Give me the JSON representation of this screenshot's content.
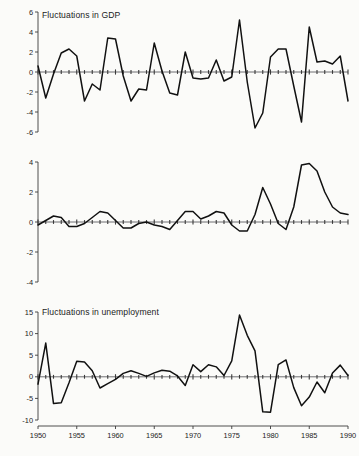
{
  "figure": {
    "background": "#fbfbf9",
    "line_color": "#111111",
    "axis_color": "#3a3a3a"
  },
  "panels": {
    "gdp": {
      "title": "Fluctuations in GDP"
    },
    "unemp": {
      "title": "Fluctuations in unemployment"
    },
    "infl": {
      "title": "Fluctuations in inflation"
    }
  },
  "chart_data": [
    {
      "type": "line",
      "title": "Fluctuations in GDP",
      "xlabel": "",
      "ylabel": "",
      "xlim": [
        1950,
        1990
      ],
      "ylim": [
        -6,
        6
      ],
      "yticks": [
        -6,
        -4,
        -2,
        0,
        2,
        4,
        6
      ],
      "ytick_labels": [
        "-6",
        "-4",
        "-2",
        "0",
        "2",
        "4",
        "6"
      ],
      "xticks": [
        1950,
        1955,
        1960,
        1965,
        1970,
        1975,
        1980,
        1985,
        1990
      ],
      "xtick_labels": [
        "1950",
        "1955",
        "1960",
        "1965",
        "1970",
        "1975",
        "1980",
        "1985",
        "1990"
      ],
      "minor_xticks_interval": 1,
      "grid": false,
      "legend": false,
      "zero_line": true,
      "x": [
        1950,
        1951,
        1952,
        1953,
        1954,
        1955,
        1956,
        1957,
        1958,
        1959,
        1960,
        1961,
        1962,
        1963,
        1964,
        1965,
        1966,
        1967,
        1968,
        1969,
        1970,
        1971,
        1972,
        1973,
        1974,
        1975,
        1976,
        1977,
        1978,
        1979,
        1980,
        1981,
        1982,
        1983,
        1984,
        1985,
        1986,
        1987,
        1988,
        1989,
        1990
      ],
      "values": [
        0.6,
        -2.6,
        -0.2,
        1.9,
        2.3,
        1.6,
        -2.9,
        -1.2,
        -1.8,
        3.4,
        3.3,
        -0.4,
        -2.9,
        -1.7,
        -1.8,
        2.9,
        0.1,
        -2.1,
        -2.3,
        2.0,
        -0.6,
        -0.7,
        -0.6,
        1.2,
        -0.9,
        -0.5,
        5.2,
        -1.0,
        -5.6,
        -4.1,
        1.5,
        2.3,
        2.3,
        -1.4,
        -5.0,
        4.5,
        1.0,
        1.1,
        0.8,
        1.6,
        -2.9
      ]
    },
    {
      "type": "line",
      "title": "Fluctuations in unemployment",
      "xlabel": "",
      "ylabel": "",
      "xlim": [
        1950,
        1990
      ],
      "ylim": [
        -4,
        4
      ],
      "yticks": [
        -4,
        -2,
        0,
        2,
        4
      ],
      "ytick_labels": [
        "-4",
        "-2",
        "0",
        "2",
        "4"
      ],
      "xticks": [
        1950,
        1955,
        1960,
        1965,
        1970,
        1975,
        1980,
        1985,
        1990
      ],
      "xtick_labels": [
        "1950",
        "1955",
        "1960",
        "1965",
        "1970",
        "1975",
        "1980",
        "1985",
        "1990"
      ],
      "minor_xticks_interval": 1,
      "grid": false,
      "legend": false,
      "zero_line": true,
      "x": [
        1950,
        1951,
        1952,
        1953,
        1954,
        1955,
        1956,
        1957,
        1958,
        1959,
        1960,
        1961,
        1962,
        1963,
        1964,
        1965,
        1966,
        1967,
        1968,
        1969,
        1970,
        1971,
        1972,
        1973,
        1974,
        1975,
        1976,
        1977,
        1978,
        1979,
        1980,
        1981,
        1982,
        1983,
        1984,
        1985,
        1986,
        1987,
        1988,
        1989,
        1990
      ],
      "values": [
        -0.2,
        0.1,
        0.4,
        0.3,
        -0.3,
        -0.3,
        -0.1,
        0.3,
        0.7,
        0.6,
        0.1,
        -0.4,
        -0.4,
        -0.1,
        0.0,
        -0.2,
        -0.3,
        -0.5,
        0.1,
        0.7,
        0.7,
        0.2,
        0.4,
        0.7,
        0.6,
        -0.2,
        -0.6,
        -0.6,
        0.5,
        2.3,
        1.2,
        -0.1,
        -0.5,
        1.0,
        3.8,
        3.9,
        3.4,
        2.0,
        1.0,
        0.6,
        0.5
      ]
    },
    {
      "type": "line",
      "title": "Fluctuations in inflation",
      "xlabel": "",
      "ylabel": "",
      "xlim": [
        1950,
        1990
      ],
      "ylim": [
        -10,
        15
      ],
      "yticks": [
        -10,
        -5,
        0,
        5,
        10,
        15
      ],
      "ytick_labels": [
        "-10",
        "-5",
        "0",
        "5",
        "10",
        "15"
      ],
      "xticks": [
        1950,
        1955,
        1960,
        1965,
        1970,
        1975,
        1980,
        1985,
        1990
      ],
      "xtick_labels": [
        "1950",
        "1955",
        "1960",
        "1965",
        "1970",
        "1975",
        "1980",
        "1985",
        "1990"
      ],
      "minor_xticks_interval": 1,
      "grid": false,
      "legend": false,
      "zero_line": true,
      "x": [
        1950,
        1951,
        1952,
        1953,
        1954,
        1955,
        1956,
        1957,
        1958,
        1959,
        1960,
        1961,
        1962,
        1963,
        1964,
        1965,
        1966,
        1967,
        1968,
        1969,
        1970,
        1971,
        1972,
        1973,
        1974,
        1975,
        1976,
        1977,
        1978,
        1979,
        1980,
        1981,
        1982,
        1983,
        1984,
        1985,
        1986,
        1987,
        1988,
        1989,
        1990
      ],
      "values": [
        -1.7,
        7.8,
        -6.2,
        -6.0,
        -1.4,
        3.6,
        3.4,
        1.4,
        -2.6,
        -1.6,
        -0.6,
        0.8,
        1.4,
        0.8,
        0.1,
        0.9,
        1.5,
        1.3,
        0.2,
        -2.0,
        2.8,
        1.2,
        2.8,
        2.3,
        0.3,
        3.7,
        14.3,
        9.6,
        6.0,
        -8.1,
        -8.2,
        2.8,
        3.9,
        -2.5,
        -6.7,
        -4.7,
        -1.2,
        -3.7,
        0.9,
        2.7,
        0.3
      ]
    }
  ]
}
